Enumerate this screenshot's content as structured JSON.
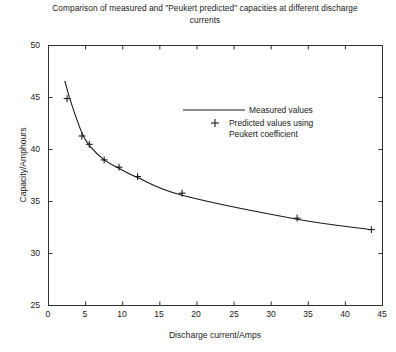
{
  "chart_data": {
    "type": "line",
    "title": "Comparison of measured and \"Peukert predicted\" capacities at different discharge currents",
    "xlabel": "Discharge current/Amps",
    "ylabel": "Capacity/Amphours",
    "xlim": [
      0,
      45
    ],
    "ylim": [
      25,
      50
    ],
    "xticks": [
      0,
      5,
      10,
      15,
      20,
      25,
      30,
      35,
      40,
      45
    ],
    "yticks": [
      25,
      30,
      35,
      40,
      45,
      50
    ],
    "grid": false,
    "legend_position": "upper-right-inside",
    "series": [
      {
        "name": "Measured values",
        "style": "line",
        "color": "#1a1a1a",
        "x": [
          2.2,
          3.0,
          4.5,
          5.5,
          7.5,
          9.5,
          12.0,
          18.0,
          33.5,
          43.5
        ],
        "y": [
          46.6,
          44.6,
          41.6,
          40.4,
          39.0,
          38.2,
          37.3,
          35.6,
          33.3,
          32.3
        ]
      },
      {
        "name": "Predicted values using Peukert coefficient",
        "style": "marker",
        "marker": "+",
        "color": "#1a1a1a",
        "x": [
          2.5,
          4.5,
          5.5,
          7.5,
          9.5,
          12.0,
          18.0,
          33.5,
          43.5
        ],
        "y": [
          44.9,
          41.3,
          40.5,
          39.0,
          38.3,
          37.4,
          35.8,
          33.4,
          32.3
        ]
      }
    ],
    "legend": [
      {
        "label": "Measured values",
        "marker": "line"
      },
      {
        "label": "Predicted values using\nPeukert coefficient",
        "marker": "plus"
      }
    ]
  }
}
